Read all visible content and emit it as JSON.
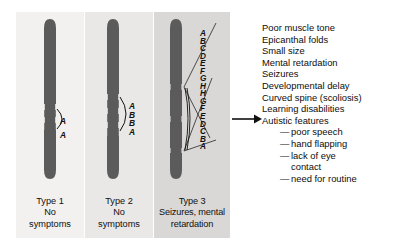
{
  "diagram": {
    "panels": [
      {
        "id": "type-1",
        "label": "Type 1",
        "description_line1": "No",
        "description_line2": "symptoms",
        "segment_letters": [
          "A",
          "A"
        ],
        "background": "#f2f1ef"
      },
      {
        "id": "type-2",
        "label": "Type 2",
        "description_line1": "No",
        "description_line2": "symptoms",
        "segment_letters": [
          "A",
          "B",
          "B",
          "A"
        ],
        "background": "#e9e8e6"
      },
      {
        "id": "type-3",
        "label": "Type 3",
        "description_line1": "Seizures, mental",
        "description_line2": "retardation",
        "segment_letters": [
          "A",
          "B",
          "C",
          "D",
          "E",
          "F",
          "G",
          "H",
          "H",
          "G",
          "F",
          "E",
          "D",
          "C",
          "B",
          "A"
        ],
        "background": "#d9d8d6"
      }
    ],
    "chromosome_color": "#5b5b5b",
    "arrow": {
      "name": "leads-to-arrow",
      "direction": "right"
    },
    "symptoms": {
      "items": [
        "Poor muscle tone",
        "Epicanthal folds",
        "Small size",
        "Mental retardation",
        "Seizures",
        "Developmental delay",
        "Curved spine (scoliosis)",
        "Learning disabilities",
        "Autistic features"
      ],
      "sub_items": [
        "poor speech",
        "hand flapping",
        "lack of eye",
        "need for routine"
      ],
      "sub_item_continuation": "contact",
      "dash": "—"
    }
  }
}
